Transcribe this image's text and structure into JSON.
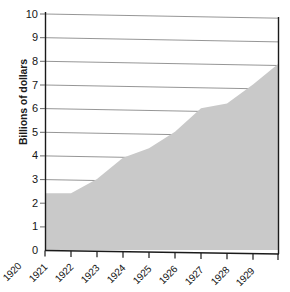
{
  "chart_data": {
    "type": "area",
    "title": "",
    "xlabel": "",
    "ylabel": "Billions of dollars",
    "categories": [
      "1920",
      "1921",
      "1922",
      "1923",
      "1924",
      "1925",
      "1926",
      "1927",
      "1928",
      "1929"
    ],
    "values": [
      2.4,
      2.4,
      3.0,
      3.9,
      4.3,
      5.0,
      6.0,
      6.2,
      7.0,
      7.9
    ],
    "series": [
      {
        "name": "",
        "values": [
          2.4,
          2.4,
          3.0,
          3.9,
          4.3,
          5.0,
          6.0,
          6.2,
          7.0,
          7.9
        ]
      }
    ],
    "ylim": [
      0,
      10
    ],
    "yticks": [
      0,
      1,
      2,
      3,
      4,
      5,
      6,
      7,
      8,
      9,
      10
    ],
    "ytick_labels": [
      "0",
      "1",
      "2",
      "3",
      "4",
      "5",
      "6",
      "7",
      "8",
      "9",
      "10"
    ],
    "xtick_labels": [
      "1920",
      "1921",
      "1922",
      "1923",
      "1924",
      "1925",
      "1926",
      "1927",
      "1928",
      "1929"
    ],
    "grid": true,
    "legend": "none",
    "colors": {
      "area_fill": "#c9c9c9",
      "gridline": "#8a8a8a",
      "axis": "#1a1a1a",
      "background": "#ffffff",
      "text": "#151515"
    }
  }
}
